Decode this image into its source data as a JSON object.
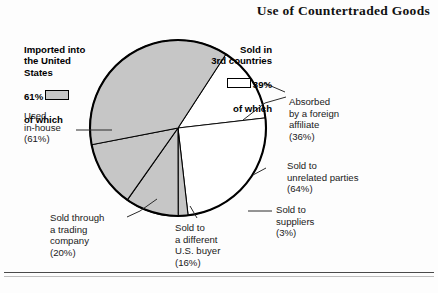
{
  "figure": {
    "title": "Use of Countertraded Goods",
    "background_color": "#fdfdfd"
  },
  "colors": {
    "slice_gray": "#c6c6c6",
    "slice_white": "#ffffff",
    "outline": "#000000",
    "text": "#1a1a1a",
    "rule": "#4a4a4a"
  },
  "legend": {
    "left": {
      "heading": "Imported into\nthe United\nStates",
      "percent": "61%",
      "swatch": "gray-swatch-icon",
      "suffix": "of which"
    },
    "right": {
      "heading": "Sold in\n3rd countries",
      "percent": "39%",
      "swatch": "white-swatch-icon",
      "suffix": "of which"
    }
  },
  "callouts": [
    {
      "name": "used-in-house",
      "text": "Used\nin-house\n(61%)"
    },
    {
      "name": "sold-through-trading",
      "text": "Sold through\na trading\ncompany\n(20%)"
    },
    {
      "name": "sold-different-buyer",
      "text": "Sold to\na different\nU.S. buyer\n(16%)"
    },
    {
      "name": "sold-to-suppliers",
      "text": "Sold to\nsuppliers\n(3%)"
    },
    {
      "name": "sold-unrelated",
      "text": "Sold to\nunrelated parties\n(64%)"
    },
    {
      "name": "absorbed-affiliate",
      "text": "Absorbed\nby a foreign\naffiliate\n(36%)"
    }
  ],
  "chart_data": {
    "type": "pie",
    "title": "Use of Countertraded Goods",
    "legend_position": "top-left and top-right",
    "grid": false,
    "center": {
      "x": 178,
      "y": 128
    },
    "radius": 88,
    "groups": [
      {
        "name": "Imported into the United States",
        "value": 61,
        "fill": "#c6c6c6",
        "label": "Imported into\nthe United\nStates",
        "children": [
          {
            "name": "Used in-house",
            "value": 61
          },
          {
            "name": "Sold through a trading company",
            "value": 20
          },
          {
            "name": "Sold to a different U.S. buyer",
            "value": 16
          },
          {
            "name": "Sold to suppliers",
            "value": 3
          }
        ]
      },
      {
        "name": "Sold in 3rd countries",
        "value": 39,
        "fill": "#ffffff",
        "label": "Sold in\n3rd countries",
        "children": [
          {
            "name": "Sold to unrelated parties",
            "value": 64
          },
          {
            "name": "Absorbed by a foreign affiliate",
            "value": 36
          }
        ]
      }
    ],
    "slices": [
      {
        "name": "Used in-house",
        "value": 61,
        "share_of_total": 37.2,
        "fill": "#c6c6c6"
      },
      {
        "name": "Sold through a trading company",
        "value": 20,
        "share_of_total": 12.2,
        "fill": "#c6c6c6"
      },
      {
        "name": "Sold to a different U.S. buyer",
        "value": 16,
        "share_of_total": 9.8,
        "fill": "#c6c6c6"
      },
      {
        "name": "Sold to suppliers",
        "value": 3,
        "share_of_total": 1.8,
        "fill": "#c6c6c6"
      },
      {
        "name": "Sold to unrelated parties",
        "value": 64,
        "share_of_total": 25.0,
        "fill": "#ffffff"
      },
      {
        "name": "Absorbed by a foreign affiliate",
        "value": 36,
        "share_of_total": 14.0,
        "fill": "#ffffff"
      }
    ],
    "categories": [
      "Used in-house",
      "Sold through a trading company",
      "Sold to a different U.S. buyer",
      "Sold to suppliers",
      "Sold to unrelated parties",
      "Absorbed by a foreign affiliate"
    ],
    "values": [
      37.2,
      12.2,
      9.8,
      1.8,
      25.0,
      14.0
    ],
    "xlabel": "",
    "ylabel": ""
  }
}
